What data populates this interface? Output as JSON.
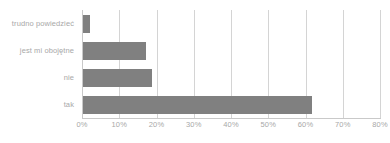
{
  "chart_data": {
    "type": "bar",
    "orientation": "horizontal",
    "title": "",
    "subtitle": "",
    "xlabel": "",
    "ylabel": "",
    "categories": [
      "trudno powiedzieć",
      "jest mi obojętne",
      "nie",
      "tak"
    ],
    "values": [
      2,
      17,
      18.5,
      61.5
    ],
    "value_suffix": "%",
    "xlim": [
      0,
      80
    ],
    "xticks": [
      0,
      10,
      20,
      30,
      40,
      50,
      60,
      70,
      80
    ],
    "xtick_labels": [
      "0%",
      "10%",
      "20%",
      "30%",
      "40%",
      "50%",
      "60%",
      "70%",
      "80%"
    ],
    "grid": true,
    "grid_axis": "x",
    "legend": false,
    "legend_position": "none",
    "annotations": [],
    "bars": [
      {
        "category": "trudno powiedzieć",
        "value": 2
      },
      {
        "category": "jest mi obojętne",
        "value": 17
      },
      {
        "category": "nie",
        "value": 18.5
      },
      {
        "category": "tak",
        "value": 61.5
      }
    ]
  },
  "colors": {
    "bar": "#808080",
    "gridline": "#d4d4d4",
    "axis_line": "#c9c9c9",
    "label_text": "#a8a8a8",
    "background": "#ffffff"
  }
}
